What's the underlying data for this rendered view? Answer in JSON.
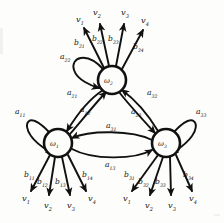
{
  "figure": {
    "type": "hidden-markov-model-state-diagram",
    "background_color": "#fdfdfc",
    "ink_color": "#111111"
  },
  "states": [
    {
      "id": "w1",
      "label": "ω",
      "sub": "1",
      "cx": 58,
      "cy": 143,
      "r": 14
    },
    {
      "id": "w2",
      "label": "ω",
      "sub": "2",
      "cx": 112,
      "cy": 80,
      "r": 14
    },
    {
      "id": "w3",
      "label": "ω",
      "sub": "3",
      "cx": 166,
      "cy": 143,
      "r": 14
    }
  ],
  "self_loops": [
    {
      "id": "a11",
      "label": "a",
      "sub": "11",
      "state": "w1",
      "lx": 15,
      "ly": 113
    },
    {
      "id": "a22",
      "label": "a",
      "sub": "22",
      "state": "w2",
      "lx": 63,
      "ly": 58
    },
    {
      "id": "a33",
      "label": "a",
      "sub": "33",
      "state": "w3",
      "lx": 198,
      "ly": 113
    }
  ],
  "transitions": [
    {
      "id": "a21",
      "label": "a",
      "sub": "21",
      "from": "w2",
      "to": "w1",
      "lx": 70,
      "ly": 94
    },
    {
      "id": "a12",
      "label": "a",
      "sub": "12",
      "from": "w1",
      "to": "w2",
      "lx": 84,
      "ly": 110
    },
    {
      "id": "a23",
      "label": "a",
      "sub": "23",
      "from": "w2",
      "to": "w3",
      "lx": 136,
      "ly": 112
    },
    {
      "id": "a32",
      "label": "a",
      "sub": "32",
      "from": "w3",
      "to": "w2",
      "lx": 151,
      "ly": 94
    },
    {
      "id": "a31",
      "label": "a",
      "sub": "31",
      "from": "w3",
      "to": "w1",
      "lx": 113,
      "ly": 127
    },
    {
      "id": "a13",
      "label": "a",
      "sub": "13",
      "from": "w1",
      "to": "w3",
      "lx": 112,
      "ly": 164
    }
  ],
  "emissions": [
    {
      "id": "b21",
      "label": "b",
      "sub": "21",
      "state": "w2",
      "lx": 80,
      "ly": 43
    },
    {
      "id": "b22",
      "label": "b",
      "sub": "22",
      "state": "w2",
      "lx": 97,
      "ly": 40
    },
    {
      "id": "b23",
      "label": "b",
      "sub": "23",
      "state": "w2",
      "lx": 111,
      "ly": 40
    },
    {
      "id": "b24",
      "label": "b",
      "sub": "24",
      "state": "w2",
      "lx": 137,
      "ly": 47
    },
    {
      "id": "b11",
      "label": "b",
      "sub": "11",
      "state": "w1",
      "lx": 27,
      "ly": 176
    },
    {
      "id": "b12",
      "label": "b",
      "sub": "12",
      "state": "w1",
      "lx": 40,
      "ly": 183
    },
    {
      "id": "b13",
      "label": "b",
      "sub": "13",
      "state": "w1",
      "lx": 57,
      "ly": 183
    },
    {
      "id": "b14",
      "label": "b",
      "sub": "14",
      "state": "w1",
      "lx": 85,
      "ly": 176
    },
    {
      "id": "b31",
      "label": "b",
      "sub": "31",
      "state": "w3",
      "lx": 127,
      "ly": 176
    },
    {
      "id": "b32",
      "label": "b",
      "sub": "32",
      "state": "w3",
      "lx": 141,
      "ly": 183
    },
    {
      "id": "b33",
      "label": "b",
      "sub": "33",
      "state": "w3",
      "lx": 157,
      "ly": 183
    },
    {
      "id": "b34",
      "label": "b",
      "sub": "34",
      "state": "w3",
      "lx": 186,
      "ly": 176
    }
  ],
  "symbols": {
    "top": [
      {
        "id": "v1-top",
        "label": "v",
        "sub": "1",
        "lx": 78,
        "ly": 20
      },
      {
        "id": "v2-top",
        "label": "v",
        "sub": "2",
        "lx": 95,
        "ly": 13
      },
      {
        "id": "v3-top",
        "label": "v",
        "sub": "3",
        "lx": 123,
        "ly": 13
      },
      {
        "id": "v4-top",
        "label": "v",
        "sub": "4",
        "lx": 143,
        "ly": 21
      }
    ],
    "bottom_left": [
      {
        "id": "v1-bl",
        "label": "v",
        "sub": "1",
        "lx": 24,
        "ly": 199
      },
      {
        "id": "v2-bl",
        "label": "v",
        "sub": "2",
        "lx": 46,
        "ly": 206
      },
      {
        "id": "v3-bl",
        "label": "v",
        "sub": "3",
        "lx": 70,
        "ly": 206
      },
      {
        "id": "v4-bl",
        "label": "v",
        "sub": "4",
        "lx": 90,
        "ly": 199
      }
    ],
    "bottom_right": [
      {
        "id": "v1-br",
        "label": "v",
        "sub": "1",
        "lx": 125,
        "ly": 199
      },
      {
        "id": "v2-br",
        "label": "v",
        "sub": "2",
        "lx": 147,
        "ly": 206
      },
      {
        "id": "v3-br",
        "label": "v",
        "sub": "3",
        "lx": 170,
        "ly": 206
      },
      {
        "id": "v4-br",
        "label": "v",
        "sub": "4",
        "lx": 191,
        "ly": 199
      }
    ]
  }
}
